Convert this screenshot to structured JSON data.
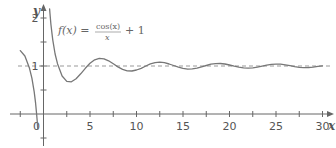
{
  "chart_data": {
    "type": "line",
    "title": "",
    "function_label": "f(x) = cos(x)/x + 1",
    "formula": {
      "lhs": "f(x) =",
      "numerator": "cos(x)",
      "denominator": "x",
      "rhs": "+ 1"
    },
    "xlabel": "x",
    "ylabel": "y",
    "xlim": [
      -4.5,
      31.5
    ],
    "ylim": [
      -0.65,
      2.3
    ],
    "x_ticks": [
      -2.5,
      0,
      2.5,
      5,
      7.5,
      10,
      12.5,
      15,
      17.5,
      20,
      22.5,
      25,
      27.5,
      30
    ],
    "x_tick_labels": [
      {
        "x": 0,
        "label": "0"
      },
      {
        "x": 5,
        "label": "5"
      },
      {
        "x": 10,
        "label": "10"
      },
      {
        "x": 15,
        "label": "15"
      },
      {
        "x": 20,
        "label": "20"
      },
      {
        "x": 25,
        "label": "25"
      },
      {
        "x": 30,
        "label": "30"
      }
    ],
    "y_ticks": [
      -0.5,
      0.5,
      1,
      1.5,
      2
    ],
    "y_tick_labels": [
      {
        "y": 1,
        "label": "1"
      },
      {
        "y": 2,
        "label": "2"
      }
    ],
    "asymptote": {
      "y": 1,
      "style": "dashed"
    },
    "grid": false,
    "legend": null,
    "series": [
      {
        "name": "left-branch",
        "x": [
          -2.5,
          -2,
          -1.5,
          -1.25,
          -1,
          -0.85,
          -0.75,
          -0.68,
          -0.62
        ],
        "y": [
          1.32,
          1.208,
          0.953,
          0.747,
          0.46,
          0.224,
          0.024,
          -0.139,
          -0.316
        ]
      },
      {
        "name": "right-branch",
        "x": [
          0.66,
          0.7,
          0.8,
          0.9,
          1,
          1.25,
          1.5,
          2,
          2.5,
          3,
          3.5,
          4,
          4.5,
          5,
          5.5,
          6,
          6.5,
          7,
          7.5,
          8,
          8.5,
          9,
          9.5,
          10,
          10.5,
          11,
          11.5,
          12,
          12.5,
          13,
          13.5,
          14,
          14.5,
          15,
          15.5,
          16,
          16.5,
          17,
          17.5,
          18,
          18.5,
          19,
          19.5,
          20,
          20.5,
          21,
          21.5,
          22,
          22.5,
          23,
          23.5,
          24,
          24.5,
          25,
          25.5,
          26,
          26.5,
          27,
          27.5,
          28,
          28.5,
          29,
          29.5,
          30
        ],
        "y": [
          2.19,
          2.09,
          1.87,
          1.69,
          1.54,
          1.25,
          1.047,
          0.792,
          0.68,
          0.67,
          0.733,
          0.837,
          0.953,
          1.057,
          1.129,
          1.16,
          1.15,
          1.108,
          1.046,
          0.982,
          0.929,
          0.899,
          0.895,
          0.916,
          0.953,
          1.0004,
          1.046,
          1.07,
          1.08,
          1.069,
          1.042,
          1.0097,
          0.977,
          0.949,
          0.936,
          0.94,
          0.957,
          0.983,
          1.011,
          1.037,
          1.05,
          1.052,
          1.041,
          1.0204,
          0.996,
          0.974,
          0.96,
          0.955,
          0.962,
          0.977,
          0.997,
          1.018,
          1.033,
          1.04,
          1.038,
          1.025,
          1.007,
          0.9866,
          0.972,
          0.967,
          0.969,
          0.977,
          0.991,
          1.005
        ]
      }
    ],
    "colors": {
      "curve": "#777777",
      "axis": "#666666",
      "asymptote": "#999999",
      "text": "#555555"
    }
  }
}
